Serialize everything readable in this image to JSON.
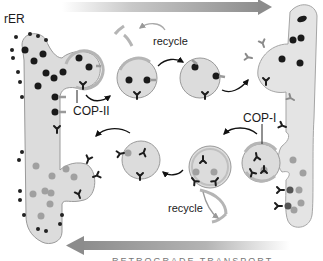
{
  "diagram": {
    "labels": {
      "er": "rER",
      "cop2": "COP-II",
      "cop1": "COP-I",
      "recycle_top": "recycle",
      "recycle_bottom": "recycle"
    },
    "arrows": {
      "top": {
        "direction": "right",
        "meaning": "anterograde transport"
      },
      "bottom": {
        "direction": "left",
        "meaning": "retrograde transport",
        "caption": "RETROGRADE TRANSPORT"
      }
    },
    "colors": {
      "membrane_fill": "#dcdcdc",
      "membrane_edge": "#9a9a9a",
      "cargo_dark": "#1a1a1a",
      "cargo_gray": "#9e9e9e",
      "receptor_dark": "#1c1c1c",
      "receptor_gray": "#8a8a8a",
      "arrow_gray": "#8c8c8c",
      "coat": "#b5b5b5"
    }
  }
}
